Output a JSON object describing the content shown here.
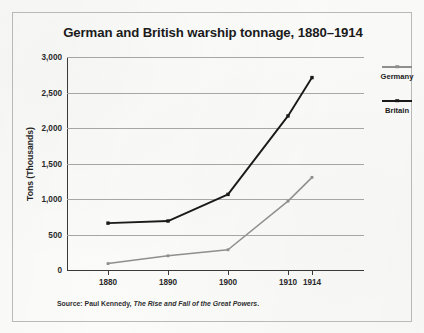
{
  "figure": {
    "title": "German and British warship tonnage, 1880–1914",
    "source_prefix": "Source: Paul Kennedy,",
    "source_title": "The Rise and Fall of the Great Powers",
    "source_suffix": "."
  },
  "legend": {
    "position": "right",
    "entries": [
      {
        "label": "Germany",
        "color": "#8f8f8f"
      },
      {
        "label": "Britain",
        "color": "#1a1a1a"
      }
    ]
  },
  "axes": {
    "y_title": "Tons (Thousands)",
    "y_ticks": [
      "0",
      "500",
      "1,000",
      "1,500",
      "2,000",
      "2,500",
      "3,000"
    ],
    "x_ticks": [
      "1880",
      "1890",
      "1900",
      "1910",
      "1914"
    ]
  },
  "chart_data": {
    "type": "line",
    "title": "German and British warship tonnage, 1880–1914",
    "xlabel": "",
    "ylabel": "Tons (Thousands)",
    "x": [
      1880,
      1890,
      1900,
      1910,
      1914
    ],
    "xtick_labels": [
      "1880",
      "1890",
      "1900",
      "1910",
      "1914"
    ],
    "ylim": [
      0,
      3000
    ],
    "ytick_values": [
      0,
      500,
      1000,
      1500,
      2000,
      2500,
      3000
    ],
    "ytick_labels": [
      "0",
      "500",
      "1,000",
      "1,500",
      "2,000",
      "2,500",
      "3,000"
    ],
    "grid": "horizontal",
    "legend_position": "right",
    "markers": "square",
    "series": [
      {
        "name": "Germany",
        "color": "#8f8f8f",
        "values": [
          90,
          200,
          285,
          970,
          1305
        ]
      },
      {
        "name": "Britain",
        "color": "#1a1a1a",
        "values": [
          660,
          690,
          1065,
          2170,
          2710
        ]
      }
    ],
    "annotations": [
      "Source: Paul Kennedy, The Rise and Fall of the Great Powers."
    ]
  }
}
